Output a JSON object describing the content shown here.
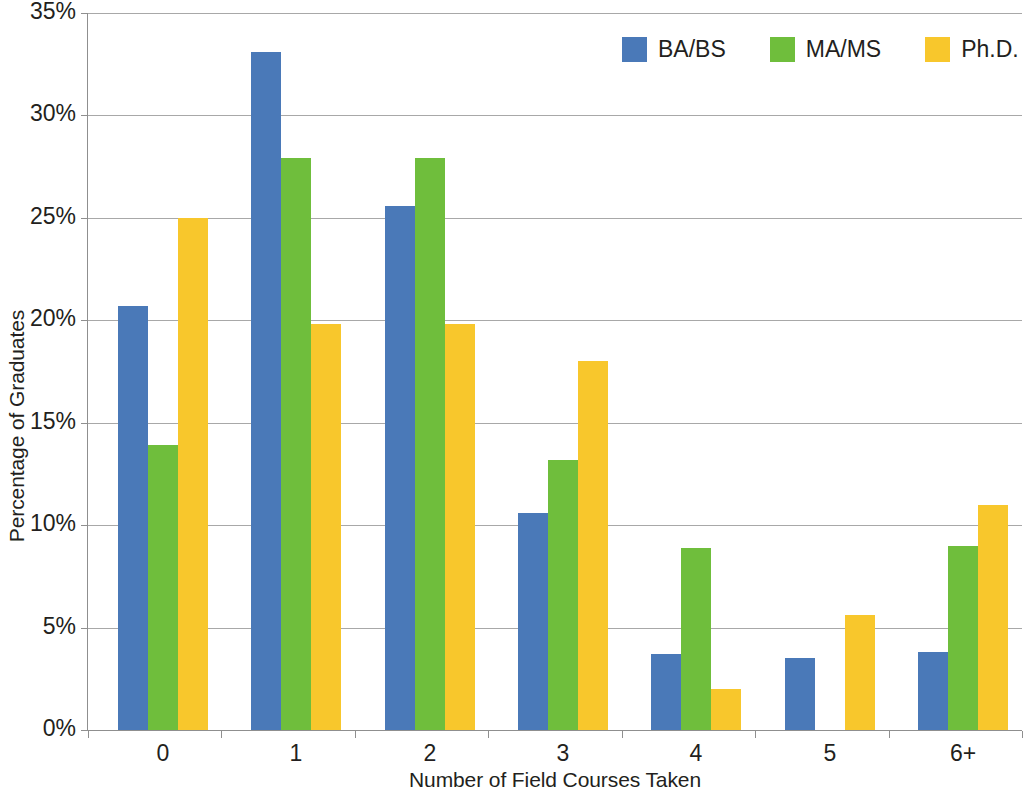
{
  "chart_data": {
    "type": "bar",
    "title": "",
    "xlabel": "Number of Field Courses Taken",
    "ylabel": "Percentage of Graduates",
    "categories": [
      "0",
      "1",
      "2",
      "3",
      "4",
      "5",
      "6+"
    ],
    "series": [
      {
        "name": "BA/BS",
        "color": "#4a79b8",
        "values": [
          20.7,
          33.1,
          25.6,
          10.6,
          3.7,
          3.5,
          3.8
        ]
      },
      {
        "name": "MA/MS",
        "color": "#6fbe3c",
        "values": [
          13.9,
          27.9,
          27.9,
          13.2,
          8.9,
          null,
          9.0
        ]
      },
      {
        "name": "Ph.D.",
        "color": "#f8c72c",
        "values": [
          25.0,
          19.8,
          19.8,
          18.0,
          2.0,
          5.6,
          11.0
        ]
      }
    ],
    "ylim": [
      0,
      35
    ],
    "ytick_values": [
      0,
      5,
      10,
      15,
      20,
      25,
      30,
      35
    ],
    "ytick_labels": [
      "0%",
      "5%",
      "10%",
      "15%",
      "20%",
      "25%",
      "30%",
      "35%"
    ],
    "grid": true,
    "legend_position": "top-right"
  },
  "legend": {
    "items": [
      {
        "label": "BA/BS",
        "color": "#4a79b8"
      },
      {
        "label": "MA/MS",
        "color": "#6fbe3c"
      },
      {
        "label": "Ph.D.",
        "color": "#f8c72c"
      }
    ]
  }
}
